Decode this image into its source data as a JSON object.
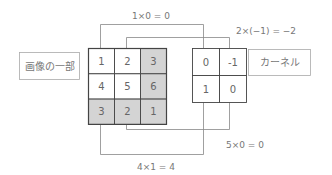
{
  "image_patch": {
    "label": "画像の一部",
    "rows": [
      [
        "1",
        "2",
        "3"
      ],
      [
        "4",
        "5",
        "6"
      ],
      [
        "3",
        "2",
        "1"
      ]
    ],
    "shaded": [
      [
        false,
        false,
        true
      ],
      [
        false,
        false,
        true
      ],
      [
        true,
        true,
        true
      ]
    ]
  },
  "kernel": {
    "label": "カーネル",
    "rows": [
      [
        "0",
        "-1"
      ],
      [
        "1",
        "0"
      ]
    ]
  },
  "products": [
    {
      "text": "1×0 = 0",
      "image_cell": [
        0,
        0
      ],
      "kernel_cell": [
        0,
        0
      ]
    },
    {
      "text": "2×(−1) = −2",
      "image_cell": [
        0,
        1
      ],
      "kernel_cell": [
        0,
        1
      ]
    },
    {
      "text": "5×0 = 0",
      "image_cell": [
        1,
        1
      ],
      "kernel_cell": [
        1,
        1
      ]
    },
    {
      "text": "4×1 = 4",
      "image_cell": [
        1,
        0
      ],
      "kernel_cell": [
        1,
        0
      ]
    }
  ],
  "colors": {
    "shade": "#d4d4d4",
    "grid_line": "#444444",
    "connector": "#888888",
    "label_border": "#aaaaaa"
  }
}
